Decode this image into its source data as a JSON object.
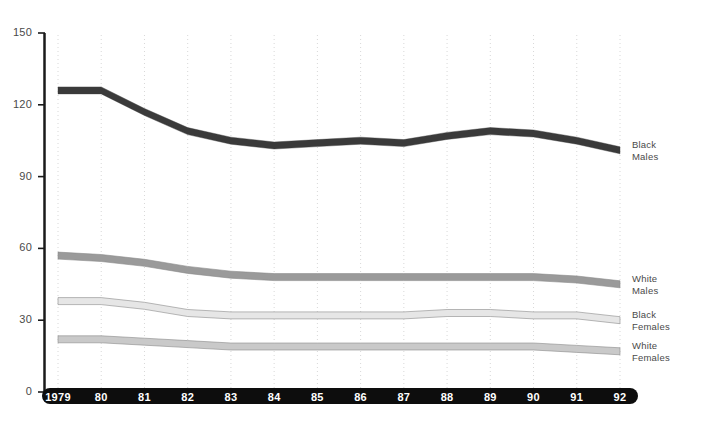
{
  "chart_data": {
    "type": "area",
    "title": "",
    "subtitle": "",
    "xlabel": "",
    "ylabel": "",
    "grid": true,
    "legend_position": "right",
    "xlim": [
      1979,
      1992
    ],
    "ylim": [
      0,
      150
    ],
    "yticks": [
      0,
      30,
      60,
      90,
      120,
      150
    ],
    "x": [
      1979,
      1980,
      1981,
      1982,
      1983,
      1984,
      1985,
      1986,
      1987,
      1988,
      1989,
      1990,
      1991,
      1992
    ],
    "xtick_labels": [
      "1979",
      "80",
      "81",
      "82",
      "83",
      "84",
      "85",
      "86",
      "87",
      "88",
      "89",
      "90",
      "91",
      "92"
    ],
    "series": [
      {
        "name": "Black Males",
        "label": "Black\nMales",
        "color": "#3a3a3a",
        "values": [
          126,
          126,
          117,
          109,
          105,
          103,
          104,
          105,
          104,
          107,
          109,
          108,
          105,
          101
        ]
      },
      {
        "name": "White Males",
        "label": "White\nMales",
        "color": "#9a9a9a",
        "values": [
          57,
          56,
          54,
          51,
          49,
          48,
          48,
          48,
          48,
          48,
          48,
          48,
          47,
          45
        ]
      },
      {
        "name": "Black Females",
        "label": "Black\nFemales",
        "color": "#e6e6e6",
        "values": [
          38,
          38,
          36,
          33,
          32,
          32,
          32,
          32,
          32,
          33,
          33,
          32,
          32,
          30
        ]
      },
      {
        "name": "White Females",
        "label": "White\nFemales",
        "color": "#c9c9c9",
        "values": [
          22,
          22,
          21,
          20,
          19,
          19,
          19,
          19,
          19,
          19,
          19,
          19,
          18,
          17
        ]
      }
    ]
  },
  "axis": {
    "y_tick_labels": [
      "150",
      "120",
      "90",
      "60",
      "30",
      "0"
    ]
  },
  "legend": {
    "items": [
      {
        "label": "Black\nMales"
      },
      {
        "label": "White\nMales"
      },
      {
        "label": "Black\nFemales"
      },
      {
        "label": "White\nFemales"
      }
    ]
  }
}
